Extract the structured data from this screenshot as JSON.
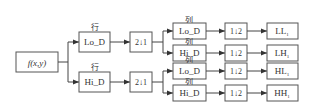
{
  "input": {
    "label": "f(x,y)"
  },
  "rows_label": "行",
  "cols_label": "列",
  "stage1": [
    {
      "filter": "Lo_D",
      "downsample": "2↓1"
    },
    {
      "filter": "Hi_D",
      "downsample": "2↓1"
    }
  ],
  "stage2": [
    {
      "filter": "Lo_D",
      "downsample": "1↓2",
      "output": "LL",
      "output_sub": "1"
    },
    {
      "filter": "Hi_D",
      "downsample": "1↓2",
      "output": "LH",
      "output_sub": "1"
    },
    {
      "filter": "Lo_D",
      "downsample": "1↓2",
      "output": "HL",
      "output_sub": "1"
    },
    {
      "filter": "Hi_D",
      "downsample": "1↓2",
      "output": "HH",
      "output_sub": "1"
    }
  ]
}
